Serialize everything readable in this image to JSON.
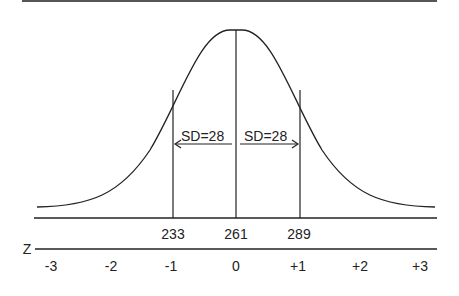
{
  "diagram": {
    "type": "normal-distribution",
    "mean": 261,
    "sd": 28,
    "sd_labels": [
      "SD=28",
      "SD=28"
    ],
    "score_labels": [
      "233",
      "261",
      "289"
    ],
    "z_axis_label": "Z",
    "z_labels": [
      "-3",
      "-2",
      "-1",
      "0",
      "+1",
      "+2",
      "+3"
    ],
    "line_color": "#222222"
  }
}
